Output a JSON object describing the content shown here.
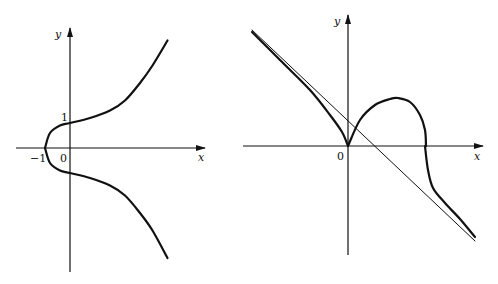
{
  "figures": [
    {
      "id": "left",
      "description": "Curve symmetric about x-axis, crossing x-axis at -1 and y-axis at 1 and -1",
      "axis_labels": {
        "x": "x",
        "y": "y"
      },
      "tick_labels": {
        "origin": "0",
        "x_neg_one": "−1",
        "y_one": "1"
      }
    },
    {
      "id": "right",
      "description": "Curve with cusp at origin, a hump above the x-axis and an oblique asymptote",
      "axis_labels": {
        "x": "x",
        "y": "y"
      },
      "tick_labels": {
        "origin": "0"
      }
    }
  ],
  "chart_data": [
    {
      "type": "line",
      "title": "",
      "xlabel": "x",
      "ylabel": "y",
      "annotations": [
        "0",
        "−1",
        "1"
      ],
      "series": [
        {
          "name": "curve-upper",
          "x": [
            -1,
            -0.8,
            -0.4,
            0,
            0.8,
            1.6,
            2.2,
            2.8,
            3.3,
            3.9
          ],
          "y": [
            0,
            0.6,
            0.9,
            1.0,
            1.2,
            1.5,
            1.9,
            2.6,
            3.3,
            4.3
          ]
        },
        {
          "name": "curve-lower",
          "x": [
            -1,
            -0.8,
            -0.4,
            0,
            0.8,
            1.6,
            2.2,
            2.8,
            3.3,
            3.9
          ],
          "y": [
            0,
            -0.6,
            -0.9,
            -1.0,
            -1.2,
            -1.5,
            -1.9,
            -2.6,
            -3.3,
            -4.4
          ]
        }
      ]
    },
    {
      "type": "line",
      "title": "",
      "xlabel": "x",
      "ylabel": "y",
      "annotations": [
        "0"
      ],
      "series": [
        {
          "name": "curve-left-branch",
          "x": [
            -3.84,
            -2.72,
            -1.52,
            -0.72,
            -0.24,
            0
          ],
          "y": [
            4.56,
            3.44,
            2.24,
            1.24,
            0.56,
            0
          ]
        },
        {
          "name": "curve-hump",
          "x": [
            0,
            0.48,
            1.08,
            1.68,
            2.0,
            2.48,
            2.88,
            3.08,
            3.12
          ],
          "y": [
            0,
            1.04,
            1.64,
            1.88,
            1.92,
            1.76,
            1.24,
            0.64,
            0
          ]
        },
        {
          "name": "curve-right-branch",
          "x": [
            3.08,
            3.2,
            3.4,
            3.88,
            4.48,
            5.08
          ],
          "y": [
            0,
            -0.96,
            -1.68,
            -2.28,
            -2.92,
            -3.64
          ]
        },
        {
          "name": "asymptote",
          "x": [
            -3.84,
            5.08
          ],
          "y": [
            4.64,
            -3.8
          ]
        }
      ]
    }
  ]
}
